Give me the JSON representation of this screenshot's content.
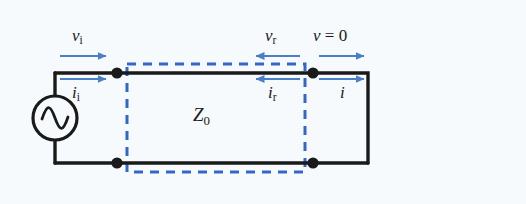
{
  "figure": {
    "colors": {
      "background": "#f7fafc",
      "wire": "#1a1a1a",
      "arrow_blue": "#4a7fc8",
      "dashed_box": "#3366cc",
      "label_text": "#1a1a1a"
    },
    "labels": {
      "incident_voltage": {
        "symbol": "v",
        "subscript": "i",
        "text": "vi"
      },
      "incident_current": {
        "symbol": "i",
        "subscript": "i",
        "text": "ii"
      },
      "reflected_voltage": {
        "symbol": "v",
        "subscript": "r",
        "text": "vr"
      },
      "reflected_current": {
        "symbol": "i",
        "subscript": "r",
        "text": "ir"
      },
      "load_voltage": {
        "symbol": "v",
        "operator": "=",
        "value": "0",
        "text": "v = 0"
      },
      "load_current": {
        "symbol": "i",
        "text": "i"
      },
      "characteristic_impedance": {
        "symbol": "Z",
        "subscript": "0",
        "text": "Z0"
      }
    },
    "components": {
      "ac_source": "ac-voltage-source",
      "transmission_line": "dashed-box-region",
      "short_circuit": "right-vertical-wire",
      "nodes": 4
    },
    "arrows": {
      "incident_voltage_direction": "right",
      "incident_current_direction": "right",
      "reflected_voltage_direction": "left",
      "reflected_current_direction": "left",
      "load_voltage_direction": "right",
      "load_current_direction": "right"
    }
  }
}
